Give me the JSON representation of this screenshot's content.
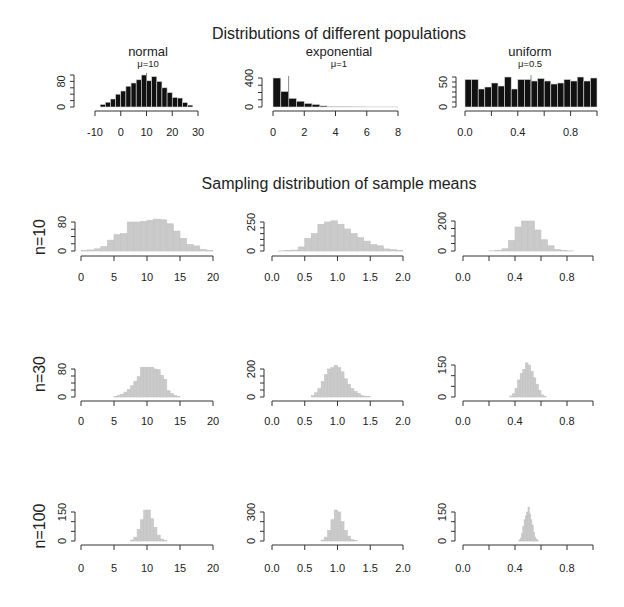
{
  "figure": {
    "title_top": "Distributions of different populations",
    "title_bottom": "Sampling distribution of sample means",
    "row_labels": [
      "n=10",
      "n=30",
      "n=100"
    ]
  },
  "chart_data": [
    {
      "type": "bar",
      "kind": "histogram",
      "row": 0,
      "col": 0,
      "title": "normal",
      "subtitle": "μ=10",
      "mean": 10,
      "xlim": [
        -10,
        30
      ],
      "xticks": [
        -10,
        0,
        10,
        20,
        30
      ],
      "xtick_labels": [
        "-10",
        "0",
        "10",
        "20",
        "30"
      ],
      "yticks": [
        0,
        20,
        40,
        60,
        80,
        100
      ],
      "ylabels": [
        {
          "v": 0,
          "t": "0"
        },
        {
          "v": 80,
          "t": "80"
        }
      ],
      "bins": {
        "start": -8,
        "width": 2,
        "counts": [
          8,
          15,
          25,
          40,
          50,
          65,
          75,
          85,
          100,
          82,
          95,
          80,
          60,
          45,
          30,
          28,
          14,
          6
        ]
      },
      "fill": "#111111",
      "border": "#d8d8d8"
    },
    {
      "type": "bar",
      "kind": "histogram",
      "row": 0,
      "col": 1,
      "title": "exponential",
      "subtitle": "μ=1",
      "mean": 1,
      "xlim": [
        0,
        8
      ],
      "xticks": [
        0,
        2,
        4,
        6,
        8
      ],
      "xtick_labels": [
        "0",
        "2",
        "4",
        "6",
        "8"
      ],
      "yticks": [
        0,
        100,
        200,
        300,
        400
      ],
      "ylabels": [
        {
          "v": 0,
          "t": "0"
        },
        {
          "v": 400,
          "t": "400"
        }
      ],
      "bins": {
        "start": 0,
        "width": 0.5,
        "counts": [
          400,
          215,
          120,
          80,
          50,
          35,
          15,
          8,
          4,
          3,
          2,
          2,
          1,
          1,
          1,
          1
        ]
      },
      "fill": "#111111",
      "border": "#d8d8d8"
    },
    {
      "type": "bar",
      "kind": "histogram",
      "row": 0,
      "col": 2,
      "title": "uniform",
      "subtitle": "μ=0.5",
      "mean": 0.5,
      "xlim": [
        0,
        1
      ],
      "xticks": [
        0,
        0.2,
        0.4,
        0.6,
        0.8,
        1.0
      ],
      "xtick_labels": [
        "0.0",
        "",
        "0.4",
        "",
        "0.8",
        ""
      ],
      "yticks": [
        0,
        10,
        20,
        30,
        40,
        50,
        60
      ],
      "ylabels": [
        {
          "v": 0,
          "t": "0"
        },
        {
          "v": 50,
          "t": "50"
        }
      ],
      "bins": {
        "start": 0,
        "width": 0.05,
        "counts": [
          55,
          55,
          36,
          40,
          48,
          42,
          60,
          36,
          55,
          55,
          52,
          57,
          52,
          46,
          48,
          55,
          52,
          60,
          52,
          58
        ]
      },
      "fill": "#111111",
      "border": "#d8d8d8"
    },
    {
      "type": "bar",
      "kind": "histogram",
      "row": 1,
      "col": 0,
      "title": "",
      "subtitle": "",
      "xlim": [
        0,
        20
      ],
      "xticks": [
        0,
        5,
        10,
        15,
        20
      ],
      "xtick_labels": [
        "0",
        "5",
        "10",
        "15",
        "20"
      ],
      "yticks": [
        0,
        20,
        40,
        60,
        80
      ],
      "ylabels": [
        {
          "v": 0,
          "t": "0"
        },
        {
          "v": 80,
          "t": "80"
        }
      ],
      "bins": {
        "start": 0,
        "width": 1,
        "counts": [
          1,
          3,
          6,
          12,
          30,
          45,
          48,
          80,
          80,
          82,
          85,
          88,
          86,
          75,
          55,
          35,
          18,
          14,
          4,
          2
        ]
      },
      "fill": "#cacaca",
      "border": "#c2c2c2"
    },
    {
      "type": "bar",
      "kind": "histogram",
      "row": 1,
      "col": 1,
      "title": "",
      "subtitle": "",
      "xlim": [
        0,
        2
      ],
      "xticks": [
        0,
        0.5,
        1,
        1.5,
        2
      ],
      "xtick_labels": [
        "0.0",
        "0.5",
        "1.0",
        "1.5",
        "2.0"
      ],
      "yticks": [
        0,
        50,
        100,
        150,
        200,
        250
      ],
      "ylabels": [
        {
          "v": 0,
          "t": "0"
        },
        {
          "v": 250,
          "t": "250"
        }
      ],
      "bins": {
        "start": 0,
        "width": 0.1,
        "counts": [
          0,
          1,
          3,
          8,
          35,
          110,
          150,
          230,
          250,
          260,
          230,
          190,
          150,
          115,
          85,
          55,
          45,
          18,
          12,
          5
        ]
      },
      "fill": "#cacaca",
      "border": "#c2c2c2"
    },
    {
      "type": "bar",
      "kind": "histogram",
      "row": 1,
      "col": 2,
      "title": "",
      "subtitle": "",
      "xlim": [
        0,
        1
      ],
      "xticks": [
        0,
        0.2,
        0.4,
        0.6,
        0.8,
        1.0
      ],
      "xtick_labels": [
        "0.0",
        "",
        "0.4",
        "",
        "0.8",
        ""
      ],
      "yticks": [
        0,
        50,
        100,
        150,
        200
      ],
      "ylabels": [
        {
          "v": 0,
          "t": "0"
        },
        {
          "v": 200,
          "t": "200"
        }
      ],
      "bins": {
        "start": 0,
        "width": 0.05,
        "counts": [
          0,
          0,
          0,
          0,
          1,
          3,
          15,
          70,
          160,
          200,
          200,
          140,
          75,
          35,
          10,
          3,
          1,
          0,
          0,
          0
        ]
      },
      "fill": "#cacaca",
      "border": "#c2c2c2"
    },
    {
      "type": "bar",
      "kind": "histogram",
      "row": 2,
      "col": 0,
      "title": "",
      "subtitle": "",
      "xlim": [
        0,
        20
      ],
      "xticks": [
        0,
        5,
        10,
        15,
        20
      ],
      "xtick_labels": [
        "0",
        "5",
        "10",
        "15",
        "20"
      ],
      "yticks": [
        0,
        20,
        40,
        60,
        80
      ],
      "ylabels": [
        {
          "v": 0,
          "t": "0"
        },
        {
          "v": 80,
          "t": "80"
        }
      ],
      "bins": {
        "start": 5,
        "width": 0.5,
        "counts": [
          2,
          5,
          8,
          14,
          22,
          32,
          45,
          58,
          85,
          85,
          85,
          85,
          80,
          78,
          62,
          50,
          18,
          10,
          4,
          2
        ]
      },
      "fill": "#cacaca",
      "border": "#c2c2c2"
    },
    {
      "type": "bar",
      "kind": "histogram",
      "row": 2,
      "col": 1,
      "title": "",
      "subtitle": "",
      "xlim": [
        0,
        2
      ],
      "xticks": [
        0,
        0.5,
        1,
        1.5,
        2
      ],
      "xtick_labels": [
        "0.0",
        "0.5",
        "1.0",
        "1.5",
        "2.0"
      ],
      "yticks": [
        0,
        50,
        100,
        150,
        200
      ],
      "ylabels": [
        {
          "v": 0,
          "t": "0"
        },
        {
          "v": 200,
          "t": "200"
        }
      ],
      "bins": {
        "start": 0.6,
        "width": 0.05,
        "counts": [
          10,
          30,
          60,
          110,
          160,
          200,
          210,
          225,
          210,
          180,
          130,
          90,
          60,
          40,
          25,
          12,
          6,
          3
        ]
      },
      "fill": "#cacaca",
      "border": "#c2c2c2"
    },
    {
      "type": "bar",
      "kind": "histogram",
      "row": 2,
      "col": 2,
      "title": "",
      "subtitle": "",
      "xlim": [
        0,
        1
      ],
      "xticks": [
        0,
        0.2,
        0.4,
        0.6,
        0.8,
        1.0
      ],
      "xtick_labels": [
        "0.0",
        "",
        "0.4",
        "",
        "0.8",
        ""
      ],
      "yticks": [
        0,
        50,
        100,
        150
      ],
      "ylabels": [
        {
          "v": 0,
          "t": "0"
        },
        {
          "v": 150,
          "t": "150"
        }
      ],
      "bins": {
        "start": 0.36,
        "width": 0.02,
        "counts": [
          5,
          15,
          40,
          80,
          110,
          130,
          160,
          150,
          120,
          90,
          60,
          30,
          10,
          4
        ]
      },
      "fill": "#cacaca",
      "border": "#c2c2c2"
    },
    {
      "type": "bar",
      "kind": "histogram",
      "row": 3,
      "col": 0,
      "title": "",
      "subtitle": "",
      "xlim": [
        0,
        20
      ],
      "xticks": [
        0,
        5,
        10,
        15,
        20
      ],
      "xtick_labels": [
        "0",
        "5",
        "10",
        "15",
        "20"
      ],
      "yticks": [
        0,
        50,
        100,
        150
      ],
      "ylabels": [
        {
          "v": 0,
          "t": "0"
        },
        {
          "v": 150,
          "t": "150"
        }
      ],
      "bins": {
        "start": 7.5,
        "width": 0.5,
        "counts": [
          5,
          20,
          60,
          110,
          160,
          160,
          115,
          70,
          30,
          10,
          3
        ]
      },
      "fill": "#cacaca",
      "border": "#c2c2c2"
    },
    {
      "type": "bar",
      "kind": "histogram",
      "row": 3,
      "col": 1,
      "title": "",
      "subtitle": "",
      "xlim": [
        0,
        2
      ],
      "xticks": [
        0,
        0.5,
        1,
        1.5,
        2
      ],
      "xtick_labels": [
        "0.0",
        "0.5",
        "1.0",
        "1.5",
        "2.0"
      ],
      "yticks": [
        0,
        100,
        200,
        300
      ],
      "ylabels": [
        {
          "v": 0,
          "t": "0"
        },
        {
          "v": 300,
          "t": "300"
        }
      ],
      "bins": {
        "start": 0.75,
        "width": 0.05,
        "counts": [
          10,
          40,
          110,
          220,
          320,
          300,
          200,
          110,
          50,
          15,
          4
        ]
      },
      "fill": "#cacaca",
      "border": "#c2c2c2"
    },
    {
      "type": "bar",
      "kind": "histogram",
      "row": 3,
      "col": 2,
      "title": "",
      "subtitle": "",
      "xlim": [
        0,
        1
      ],
      "xticks": [
        0,
        0.2,
        0.4,
        0.6,
        0.8,
        1.0
      ],
      "xtick_labels": [
        "0.0",
        "",
        "0.4",
        "",
        "0.8",
        ""
      ],
      "yticks": [
        0,
        50,
        100,
        150
      ],
      "ylabels": [
        {
          "v": 0,
          "t": "0"
        },
        {
          "v": 150,
          "t": "150"
        }
      ],
      "bins": {
        "start": 0.43,
        "width": 0.01,
        "counts": [
          5,
          15,
          40,
          75,
          110,
          130,
          150,
          175,
          140,
          110,
          80,
          45,
          20,
          8,
          3
        ]
      },
      "fill": "#cacaca",
      "border": "#c2c2c2"
    }
  ]
}
